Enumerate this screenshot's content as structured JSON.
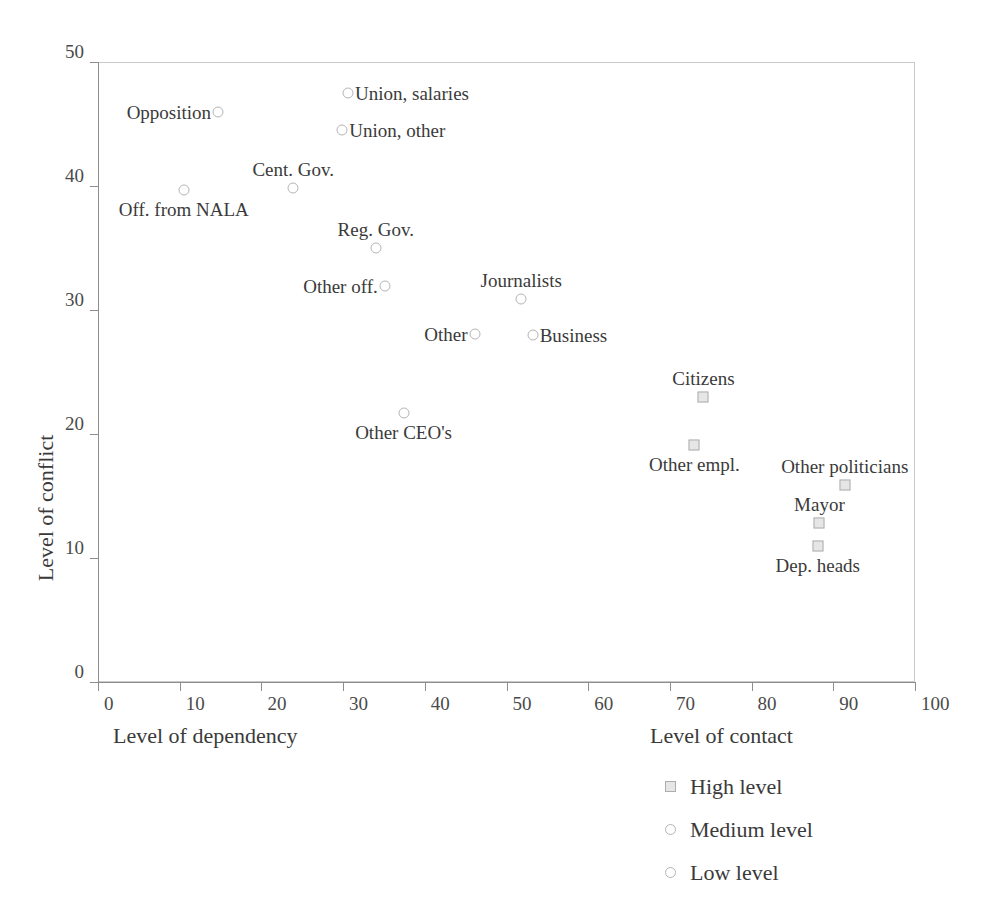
{
  "top_caption": "",
  "chart_data": {
    "type": "scatter",
    "title": "",
    "xlabel": "Level of dependency",
    "xlabel_secondary": "Level of contact",
    "ylabel": "Level of conflict",
    "xlim": [
      0,
      100
    ],
    "ylim": [
      0,
      50
    ],
    "xticks": [
      0,
      10,
      20,
      30,
      40,
      50,
      60,
      70,
      80,
      90,
      100
    ],
    "yticks": [
      0,
      10,
      20,
      30,
      40,
      50
    ],
    "grid": false,
    "legend_position": "bottom-right",
    "legend": [
      {
        "label": "High level",
        "marker": "square"
      },
      {
        "label": "Medium level",
        "marker": "circle"
      },
      {
        "label": "Low level",
        "marker": "circle"
      }
    ],
    "points": [
      {
        "label": "Opposition",
        "x": 14.7,
        "y": 46.0,
        "marker": "circle",
        "label_pos": "left"
      },
      {
        "label": "Union, salaries",
        "x": 30.6,
        "y": 47.5,
        "marker": "circle",
        "label_pos": "right"
      },
      {
        "label": "Union, other",
        "x": 29.9,
        "y": 44.5,
        "marker": "circle",
        "label_pos": "right"
      },
      {
        "label": "Cent. Gov.",
        "x": 23.9,
        "y": 39.8,
        "marker": "circle",
        "label_pos": "above"
      },
      {
        "label": "Off. from NALA",
        "x": 10.5,
        "y": 39.7,
        "marker": "circle",
        "label_pos": "below"
      },
      {
        "label": "Reg. Gov.",
        "x": 34.0,
        "y": 35.0,
        "marker": "circle",
        "label_pos": "above"
      },
      {
        "label": "Other off.",
        "x": 35.1,
        "y": 31.9,
        "marker": "circle",
        "label_pos": "left"
      },
      {
        "label": "Journalists",
        "x": 51.8,
        "y": 30.9,
        "marker": "circle",
        "label_pos": "above"
      },
      {
        "label": "Other",
        "x": 46.1,
        "y": 28.1,
        "marker": "circle",
        "label_pos": "left"
      },
      {
        "label": "Business",
        "x": 53.2,
        "y": 28.0,
        "marker": "circle",
        "label_pos": "right"
      },
      {
        "label": "Other CEO's",
        "x": 37.4,
        "y": 21.7,
        "marker": "circle",
        "label_pos": "below"
      },
      {
        "label": "Citizens",
        "x": 74.1,
        "y": 23.0,
        "marker": "square",
        "label_pos": "above"
      },
      {
        "label": "Other empl.",
        "x": 73.0,
        "y": 19.1,
        "marker": "square",
        "label_pos": "below"
      },
      {
        "label": "Other politicians",
        "x": 91.4,
        "y": 15.9,
        "marker": "square",
        "label_pos": "above"
      },
      {
        "label": "Mayor",
        "x": 88.3,
        "y": 12.8,
        "marker": "square",
        "label_pos": "above"
      },
      {
        "label": "Dep. heads",
        "x": 88.1,
        "y": 11.0,
        "marker": "square",
        "label_pos": "below"
      }
    ]
  }
}
